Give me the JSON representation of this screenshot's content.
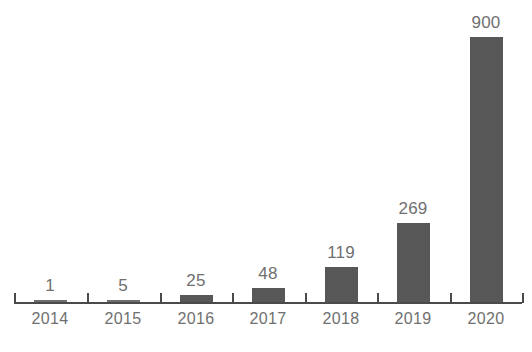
{
  "chart_data": {
    "type": "bar",
    "title": "",
    "subtitle": "",
    "xlabel": "",
    "ylabel": "",
    "categories": [
      "2014",
      "2015",
      "2016",
      "2017",
      "2018",
      "2019",
      "2020"
    ],
    "values": [
      1,
      5,
      25,
      48,
      119,
      269,
      900
    ],
    "value_labels": [
      "1",
      "5",
      "25",
      "48",
      "119",
      "269",
      "900"
    ],
    "ylim": [
      0,
      900
    ],
    "grid": false,
    "legend": null,
    "legend_position": "none",
    "annotations": [],
    "colors": {
      "bar": "#575757",
      "axis": "#4a4a4a",
      "value_label": "#6f6f6f",
      "category_label": "#707070",
      "background": "#ffffff"
    }
  },
  "caption": {
    "text": ""
  }
}
